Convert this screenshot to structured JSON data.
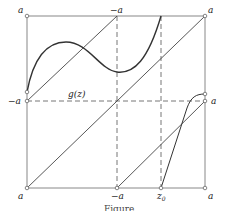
{
  "diagram": {
    "labels": {
      "top_left": "a",
      "top_mid": "−a",
      "top_right": "a",
      "left_mid": "−a",
      "right_mid": "a",
      "bottom_left": "a",
      "bottom_mid": "−a",
      "bottom_x0": "z",
      "bottom_x0_sub": "0",
      "bottom_right": "a",
      "curve": "g(z)"
    },
    "caption": "Figure",
    "colors": {
      "frame": "#777777",
      "curve": "#333333",
      "dashed": "#666666"
    }
  }
}
